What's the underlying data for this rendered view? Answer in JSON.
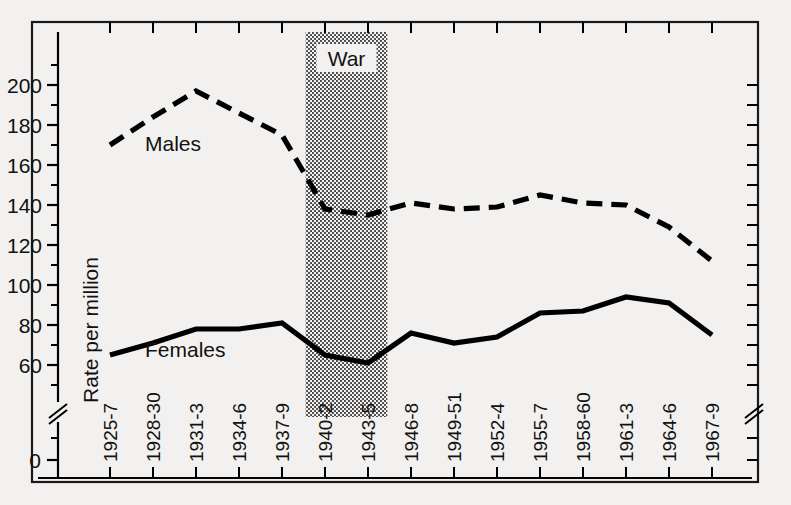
{
  "chart_data": {
    "type": "line",
    "title": "",
    "xlabel": "",
    "ylabel": "Rate per million",
    "ylim": [
      0,
      210
    ],
    "y_axis_break": true,
    "x_axis_break": true,
    "grid": false,
    "legend_position": "inline-annotations",
    "y_ticks_major": [
      0,
      60,
      80,
      100,
      120,
      140,
      160,
      180,
      200
    ],
    "y_ticks_minor": [
      70,
      90,
      110,
      130,
      150,
      170,
      190,
      210
    ],
    "categories": [
      "1925-7",
      "1928-30",
      "1931-3",
      "1934-6",
      "1937-9",
      "1940-2",
      "1943-5",
      "1946-8",
      "1949-51",
      "1952-4",
      "1955-7",
      "1958-60",
      "1961-3",
      "1964-6",
      "1967-9"
    ],
    "series": [
      {
        "name": "Males",
        "style": "dashed",
        "color": "#000000",
        "values": [
          170,
          184,
          197,
          186,
          175,
          138,
          135,
          141,
          138,
          139,
          145,
          141,
          140,
          129,
          112
        ]
      },
      {
        "name": "Females",
        "style": "solid",
        "color": "#000000",
        "values": [
          65,
          71,
          78,
          78,
          81,
          65,
          61,
          76,
          71,
          74,
          86,
          87,
          94,
          91,
          75
        ]
      }
    ],
    "annotations": [
      {
        "text": "Males",
        "category_near": "1928-30",
        "value_near": 167
      },
      {
        "text": "Females",
        "category_near": "1928-30",
        "value_near": 64
      },
      {
        "text": "War",
        "span_categories": [
          "1940-2",
          "1943-5"
        ],
        "kind": "shaded-band",
        "fill": "stipple"
      }
    ],
    "shaded_band": {
      "label": "War",
      "start_category": "1940-2",
      "end_category": "1943-5",
      "start_offset": -0.45,
      "end_offset": 0.45
    }
  },
  "figure": {
    "background": "#f2f1ef",
    "frame_color": "#1a1a1a",
    "ink_color": "#000000"
  }
}
